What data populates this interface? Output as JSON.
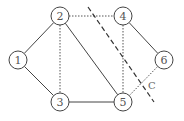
{
  "diagram": {
    "type": "graph",
    "nodes": [
      {
        "id": "1",
        "label": "1",
        "x": 18,
        "y": 60
      },
      {
        "id": "2",
        "label": "2",
        "x": 60,
        "y": 16
      },
      {
        "id": "3",
        "label": "3",
        "x": 60,
        "y": 102
      },
      {
        "id": "4",
        "label": "4",
        "x": 123,
        "y": 16
      },
      {
        "id": "5",
        "label": "5",
        "x": 123,
        "y": 102
      },
      {
        "id": "6",
        "label": "6",
        "x": 164,
        "y": 60
      }
    ],
    "edges": [
      {
        "from": "1",
        "to": "2",
        "style": "solid"
      },
      {
        "from": "1",
        "to": "3",
        "style": "solid"
      },
      {
        "from": "2",
        "to": "5",
        "style": "solid"
      },
      {
        "from": "3",
        "to": "5",
        "style": "solid"
      },
      {
        "from": "4",
        "to": "6",
        "style": "solid"
      },
      {
        "from": "2",
        "to": "4",
        "style": "dotted"
      },
      {
        "from": "2",
        "to": "3",
        "style": "dotted"
      },
      {
        "from": "4",
        "to": "5",
        "style": "dotted"
      },
      {
        "from": "5",
        "to": "6",
        "style": "dotted"
      }
    ],
    "cut": {
      "label": "C",
      "x1": 88,
      "y1": 7,
      "x2": 154,
      "y2": 102,
      "label_x": 148,
      "label_y": 89
    }
  }
}
